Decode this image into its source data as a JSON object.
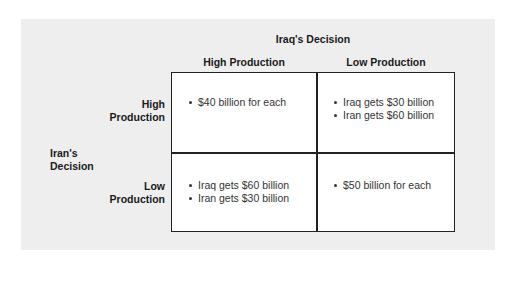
{
  "matrix": {
    "column_player_label": "Iraq's Decision",
    "row_player_label_line1": "Iran's",
    "row_player_label_line2": "Decision",
    "columns": [
      "High Production",
      "Low Production"
    ],
    "rows": [
      {
        "line1": "High",
        "line2": "Production"
      },
      {
        "line1": "Low",
        "line2": "Production"
      }
    ],
    "cells": [
      [
        [
          "$40 billion for each"
        ],
        [
          "Iraq gets $30 billion",
          "Iran gets $60 billion"
        ]
      ],
      [
        [
          "Iraq gets $60 billion",
          "Iran gets $30 billion"
        ],
        [
          "$50 billion for each"
        ]
      ]
    ]
  }
}
